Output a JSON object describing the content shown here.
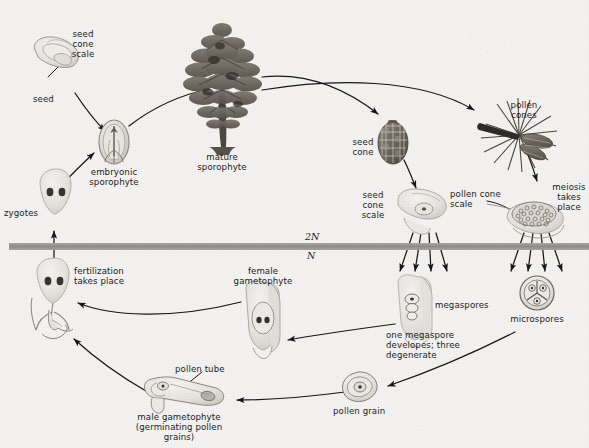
{
  "figure": {
    "background_color": "#f3f2f0",
    "ink_color": "#1b1b1b",
    "ploidy_bar_color": "#9b9894"
  },
  "ploidy": {
    "diploid_label": "2N",
    "haploid_label": "N"
  },
  "labels": {
    "seed_cone_scale_top": "seed\ncone\nscale",
    "seed": "seed",
    "embryonic_sporophyte": "embryonic\nsporophyte",
    "mature_sporophyte": "mature\nsporophyte",
    "zygotes": "zygotes",
    "seed_cone": "seed\ncone",
    "seed_cone_scale_mid": "seed\ncone\nscale",
    "pollen_cones": "pollen\ncones",
    "pollen_cone_scale": "pollen cone\nscale",
    "meiosis_takes_place": "meiosis\ntakes\nplace",
    "fertilization_takes_place": "fertilization\ntakes place",
    "female_gametophyte": "female\ngametophyte",
    "megaspores": "megaspores",
    "one_megaspore": "one megaspore\ndevelopes; three\ndegenerate",
    "microspores": "microspores",
    "pollen_grain": "pollen grain",
    "pollen_tube": "pollen tube",
    "male_gametophyte": "male gametophyte\n(germinating pollen\ngrains)"
  },
  "stages": [
    {
      "id": "seed-cone-scale-with-seed",
      "label": "seed cone scale",
      "ploidy": "2N"
    },
    {
      "id": "embryonic-sporophyte",
      "label": "embryonic sporophyte",
      "ploidy": "2N"
    },
    {
      "id": "mature-sporophyte",
      "label": "mature sporophyte",
      "ploidy": "2N"
    },
    {
      "id": "seed-cone",
      "label": "seed cone",
      "ploidy": "2N"
    },
    {
      "id": "seed-cone-scale-ovule",
      "label": "seed cone scale",
      "ploidy": "2N"
    },
    {
      "id": "pollen-cones",
      "label": "pollen cones",
      "ploidy": "2N"
    },
    {
      "id": "pollen-cone-scale",
      "label": "pollen cone scale",
      "ploidy": "2N"
    },
    {
      "id": "megaspores",
      "label": "megaspores",
      "ploidy": "N"
    },
    {
      "id": "microspores",
      "label": "microspores",
      "ploidy": "N"
    },
    {
      "id": "female-gametophyte",
      "label": "female gametophyte",
      "ploidy": "N"
    },
    {
      "id": "pollen-grain",
      "label": "pollen grain",
      "ploidy": "N"
    },
    {
      "id": "male-gametophyte",
      "label": "male gametophyte",
      "ploidy": "N"
    },
    {
      "id": "fertilization",
      "label": "fertilization takes place",
      "ploidy": "N"
    },
    {
      "id": "zygotes",
      "label": "zygotes",
      "ploidy": "2N"
    }
  ],
  "processes": [
    {
      "id": "meiosis",
      "label": "meiosis takes place"
    },
    {
      "id": "fertilization",
      "label": "fertilization takes place"
    },
    {
      "id": "megaspore-selection",
      "label": "one megaspore developes; three degenerate"
    }
  ]
}
